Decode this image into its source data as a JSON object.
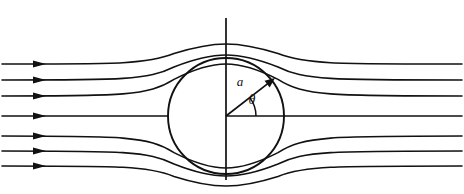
{
  "figure": {
    "name": "potential-flow-past-circular-cylinder",
    "width": 464,
    "height": 194,
    "background_color": "#ffffff",
    "line_color": "#111111"
  },
  "labels": {
    "radius_label": "a",
    "angle_label": "θ"
  },
  "geometry": {
    "circle": {
      "cx": 226,
      "cy": 116,
      "r": 58
    },
    "vertical_axis": {
      "x": 226,
      "y_top": 18,
      "y_bottom": 180
    },
    "radius_vector": {
      "x1": 226,
      "y1": 116,
      "x2": 275,
      "y2": 78,
      "angle_deg": 38
    },
    "angle_baseline": {
      "x1": 226,
      "y1": 116,
      "x2": 285,
      "y2": 116
    },
    "angle_arc_radius": 30
  },
  "label_positions": {
    "radius_label": {
      "x": 240,
      "y": 86
    },
    "angle_label": {
      "x": 252,
      "y": 104
    }
  },
  "chart_data": {
    "type": "line",
    "title": "",
    "xlabel": "",
    "ylabel": "",
    "grid": false,
    "legend": "none",
    "xlim": [
      0,
      464
    ],
    "ylim": [
      0,
      194
    ],
    "inlet_arrow_x": 46,
    "series": [
      {
        "name": "streamline-1",
        "inlet_y": 64,
        "outlet_y": 64,
        "deflection": 20,
        "arrow": true
      },
      {
        "name": "streamline-2",
        "inlet_y": 80,
        "outlet_y": 80,
        "deflection": 25,
        "arrow": true
      },
      {
        "name": "streamline-3",
        "inlet_y": 96,
        "outlet_y": 96,
        "deflection": 32,
        "arrow": true
      },
      {
        "name": "stagnation-streamline",
        "inlet_y": 116,
        "outlet_y": 116,
        "deflection": 0,
        "arrow": true
      },
      {
        "name": "streamline-5",
        "inlet_y": 136,
        "outlet_y": 136,
        "deflection": -32,
        "arrow": true
      },
      {
        "name": "streamline-6",
        "inlet_y": 151,
        "outlet_y": 151,
        "deflection": -25,
        "arrow": true
      },
      {
        "name": "streamline-7",
        "inlet_y": 166,
        "outlet_y": 166,
        "deflection": -20,
        "arrow": true
      }
    ]
  }
}
